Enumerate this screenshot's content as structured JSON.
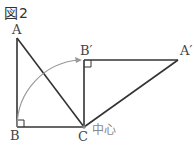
{
  "figure": {
    "title": "図2",
    "labels": {
      "A": "A",
      "B": "B",
      "C": "C",
      "B_prime": "B′",
      "A_prime": "A′",
      "center": "中心"
    },
    "colors": {
      "line": "#333333",
      "arc": "#999999",
      "center_label": "#888888"
    }
  }
}
